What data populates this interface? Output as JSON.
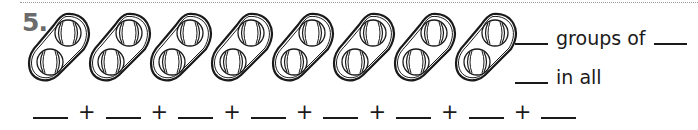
{
  "problem": {
    "number": "5.",
    "groups_count": 8,
    "items_per_group": 2,
    "item_icon": "baseball-icon",
    "group_icon": "oval-group-icon"
  },
  "prompts": {
    "groups_of": "groups of",
    "in_all": "in all"
  },
  "addition": {
    "operator": "+",
    "blank_count": 8
  },
  "colors": {
    "number": "#6b6b6b",
    "ink": "#1a1a1a",
    "dotted_rule": "#9a9a9a"
  }
}
